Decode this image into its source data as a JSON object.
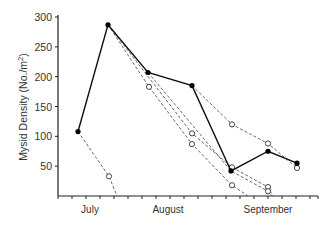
{
  "chart_data": {
    "type": "line",
    "title": "",
    "xlabel": "",
    "ylabel": "Mysid Density (No./m²)",
    "ylabel_main": "Mysid Density (No./m",
    "ylabel_sup": "2",
    "ylabel_close": ")",
    "ylim": [
      0,
      300
    ],
    "yticks": [
      50,
      100,
      150,
      200,
      250,
      300
    ],
    "ytick_labels": [
      "50",
      "100",
      "150",
      "200",
      "250",
      "300"
    ],
    "x_range_px": [
      58,
      318
    ],
    "month_labels": [
      {
        "label": "July",
        "x": 90
      },
      {
        "label": "August",
        "x": 168
      },
      {
        "label": "September",
        "x": 268
      }
    ],
    "x_minor_ticks_px": [
      58,
      72,
      86,
      100,
      114,
      128,
      142,
      156,
      170,
      184,
      198,
      212,
      226,
      240,
      254,
      268,
      282,
      296,
      310,
      318
    ],
    "grid": false,
    "legend": null,
    "series": [
      {
        "name": "Observed density",
        "style": "solid",
        "marker": "filled",
        "points": [
          {
            "x": 78,
            "y": 108
          },
          {
            "x": 108,
            "y": 287
          },
          {
            "x": 148,
            "y": 207
          },
          {
            "x": 192,
            "y": 185
          },
          {
            "x": 231,
            "y": 42
          },
          {
            "x": 268,
            "y": 75
          },
          {
            "x": 297,
            "y": 55
          }
        ]
      },
      {
        "name": "Decline from July 108",
        "style": "dashed",
        "marker": "open",
        "points": [
          {
            "x": 78,
            "y": 108,
            "hidden_marker": true
          },
          {
            "x": 109,
            "y": 33
          },
          {
            "x": 117,
            "y": 0,
            "hidden_marker": true
          }
        ]
      },
      {
        "name": "Decline from 287 peak",
        "style": "dashed",
        "marker": "open",
        "points": [
          {
            "x": 108,
            "y": 287,
            "hidden_marker": true
          },
          {
            "x": 149,
            "y": 183
          },
          {
            "x": 192,
            "y": 87
          },
          {
            "x": 232,
            "y": 18
          },
          {
            "x": 248,
            "y": 0,
            "hidden_marker": true
          }
        ]
      },
      {
        "name": "Decline from 287 peak (b)",
        "style": "dashed",
        "marker": "open",
        "points": [
          {
            "x": 108,
            "y": 287,
            "hidden_marker": true
          },
          {
            "x": 192,
            "y": 105
          },
          {
            "x": 232,
            "y": 48
          },
          {
            "x": 268,
            "y": 15
          },
          {
            "x": 273,
            "y": 0,
            "hidden_marker": true
          }
        ]
      },
      {
        "name": "Decline from 207",
        "style": "dashed",
        "marker": "open",
        "points": [
          {
            "x": 148,
            "y": 207,
            "hidden_marker": true
          },
          {
            "x": 231,
            "y": 42,
            "hidden_marker": true
          },
          {
            "x": 268,
            "y": 8
          },
          {
            "x": 272,
            "y": 0,
            "hidden_marker": true
          }
        ]
      },
      {
        "name": "Decline from 185",
        "style": "dashed",
        "marker": "open",
        "points": [
          {
            "x": 192,
            "y": 185,
            "hidden_marker": true
          },
          {
            "x": 232,
            "y": 120
          },
          {
            "x": 268,
            "y": 88
          },
          {
            "x": 297,
            "y": 47
          }
        ]
      }
    ]
  }
}
